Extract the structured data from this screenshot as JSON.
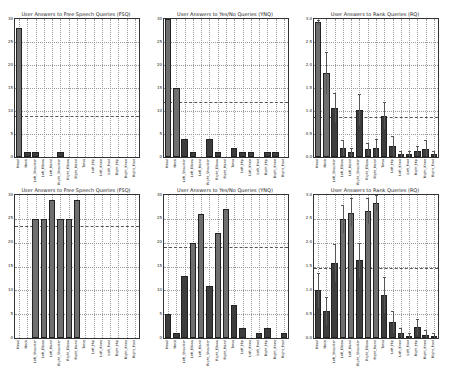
{
  "figure": {
    "colors": {
      "light_bar": "#6f6f6f",
      "dark_bar": "#3d3d3d",
      "grid": "#9a9a9a",
      "reference_line": "#555555"
    }
  },
  "chart_data": [
    {
      "type": "bar",
      "title": "User Answers to Free Speech Queries (FSQ)",
      "categories": [
        "Head",
        "Neck",
        "Left_Shoulder",
        "Left_Elbow",
        "Left_Hand",
        "Right_Shoulder",
        "Right_Elbow",
        "Right_Hand",
        "Torso",
        "Left_Hip",
        "Left_Knee",
        "Left_Foot",
        "Right_Hip",
        "Right_Knee",
        "Right_Foot"
      ],
      "values": [
        28,
        1,
        1,
        0,
        0,
        1,
        0,
        0,
        0,
        0,
        0,
        0,
        0,
        0,
        0
      ],
      "highlight": [
        true,
        false,
        false,
        false,
        false,
        false,
        false,
        false,
        false,
        false,
        false,
        false,
        false,
        false,
        false
      ],
      "errors": null,
      "ylim": [
        0,
        30
      ],
      "yticks": [
        "0",
        "5",
        "10",
        "15",
        "20",
        "25",
        "30"
      ],
      "reference_line": 9,
      "grid": true,
      "xlabel": "",
      "ylabel": ""
    },
    {
      "type": "bar",
      "title": "User Answers to Yes/No Queries (YNQ)",
      "categories": [
        "Head",
        "Neck",
        "Left_Shoulder",
        "Left_Elbow",
        "Left_Hand",
        "Right_Shoulder",
        "Right_Elbow",
        "Right_Hand",
        "Torso",
        "Left_Hip",
        "Left_Knee",
        "Left_Foot",
        "Right_Hip",
        "Right_Knee",
        "Right_Foot"
      ],
      "values": [
        30,
        15,
        4,
        1,
        0,
        4,
        1,
        0,
        2,
        1,
        1,
        0,
        1,
        1,
        0
      ],
      "highlight": [
        true,
        true,
        false,
        false,
        false,
        false,
        false,
        false,
        false,
        false,
        false,
        false,
        false,
        false,
        false
      ],
      "errors": null,
      "ylim": [
        0,
        30
      ],
      "yticks": [
        "0",
        "5",
        "10",
        "15",
        "20",
        "25",
        "30"
      ],
      "reference_line": 12,
      "grid": true,
      "xlabel": "",
      "ylabel": ""
    },
    {
      "type": "bar",
      "title": "User Answers to Rank Queries (RQ)",
      "categories": [
        "Head",
        "Neck",
        "Left_Shoulder",
        "Left_Elbow",
        "Left_Hand",
        "Right_Shoulder",
        "Right_Elbow",
        "Right_Hand",
        "Torso",
        "Left_Hip",
        "Left_Knee",
        "Left_Foot",
        "Right_Hip",
        "Right_Knee",
        "Right_Foot"
      ],
      "values": [
        2.93,
        1.83,
        1.07,
        0.2,
        0.1,
        1.03,
        0.17,
        0.2,
        0.9,
        0.23,
        0.07,
        0.07,
        0.13,
        0.17,
        0.07
      ],
      "highlight": [
        true,
        true,
        false,
        false,
        false,
        false,
        false,
        false,
        false,
        false,
        false,
        false,
        false,
        false,
        false
      ],
      "errors": [
        0.05,
        0.45,
        0.33,
        0.17,
        0.1,
        0.33,
        0.13,
        0.2,
        0.3,
        0.23,
        0.07,
        0.07,
        0.1,
        0.2,
        0.07
      ],
      "ylim": [
        0,
        3.0
      ],
      "yticks": [
        "0.0",
        "0.5",
        "1.0",
        "1.5",
        "2.0",
        "2.5",
        "3.0"
      ],
      "reference_line": 0.88,
      "grid": true,
      "xlabel": "",
      "ylabel": ""
    },
    {
      "type": "bar",
      "title": "User Answers to Free Speech Queries (FSQ)",
      "categories": [
        "Head",
        "Neck",
        "Left_Shoulder",
        "Left_Elbow",
        "Left_Hand",
        "Right_Shoulder",
        "Right_Elbow",
        "Right_Hand",
        "Torso",
        "Left_Hip",
        "Left_Knee",
        "Left_Foot",
        "Right_Hip",
        "Right_Knee",
        "Right_Foot"
      ],
      "values": [
        0,
        0,
        25,
        25,
        29,
        25,
        25,
        29,
        0,
        0,
        0,
        0,
        0,
        0,
        0
      ],
      "highlight": [
        false,
        false,
        true,
        true,
        true,
        true,
        true,
        true,
        false,
        false,
        false,
        false,
        false,
        false,
        false
      ],
      "errors": null,
      "ylim": [
        0,
        30
      ],
      "yticks": [
        "0",
        "5",
        "10",
        "15",
        "20",
        "25",
        "30"
      ],
      "reference_line": 23.5,
      "grid": true,
      "xlabel": "",
      "ylabel": ""
    },
    {
      "type": "bar",
      "title": "User Answers to Yes/No Queries (YNQ)",
      "categories": [
        "Head",
        "Neck",
        "Left_Shoulder",
        "Left_Elbow",
        "Left_Hand",
        "Right_Shoulder",
        "Right_Elbow",
        "Right_Hand",
        "Torso",
        "Left_Hip",
        "Left_Knee",
        "Left_Foot",
        "Right_Hip",
        "Right_Knee",
        "Right_Foot"
      ],
      "values": [
        5,
        1,
        13,
        20,
        26,
        11,
        22,
        27,
        7,
        2,
        0,
        1,
        2,
        0,
        1
      ],
      "highlight": [
        false,
        false,
        false,
        true,
        true,
        false,
        true,
        true,
        false,
        false,
        false,
        false,
        false,
        false,
        false
      ],
      "errors": null,
      "ylim": [
        0,
        30
      ],
      "yticks": [
        "0",
        "5",
        "10",
        "15",
        "20",
        "25",
        "30"
      ],
      "reference_line": 19,
      "grid": true,
      "xlabel": "",
      "ylabel": ""
    },
    {
      "type": "bar",
      "title": "User Answers to Rank Queries (RQ)",
      "categories": [
        "Head",
        "Neck",
        "Left_Shoulder",
        "Left_Elbow",
        "Left_Hand",
        "Right_Shoulder",
        "Right_Elbow",
        "Right_Hand",
        "Torso",
        "Left_Hip",
        "Left_Knee",
        "Left_Foot",
        "Right_Hip",
        "Right_Knee",
        "Right_Foot"
      ],
      "values": [
        1.0,
        0.57,
        1.57,
        2.5,
        2.63,
        1.63,
        2.67,
        2.83,
        0.9,
        0.33,
        0.1,
        0.03,
        0.23,
        0.07,
        0.03
      ],
      "highlight": [
        false,
        false,
        false,
        true,
        true,
        false,
        true,
        true,
        false,
        false,
        false,
        false,
        false,
        false,
        false
      ],
      "errors": [
        0.37,
        0.3,
        0.4,
        0.3,
        0.3,
        0.37,
        0.27,
        0.17,
        0.37,
        0.23,
        0.1,
        0.07,
        0.17,
        0.1,
        0.07
      ],
      "ylim": [
        0,
        3.0
      ],
      "yticks": [
        "0.0",
        "0.5",
        "1.0",
        "1.5",
        "2.0",
        "2.5",
        "3.0"
      ],
      "reference_line": 1.47,
      "grid": true,
      "xlabel": "",
      "ylabel": ""
    }
  ]
}
